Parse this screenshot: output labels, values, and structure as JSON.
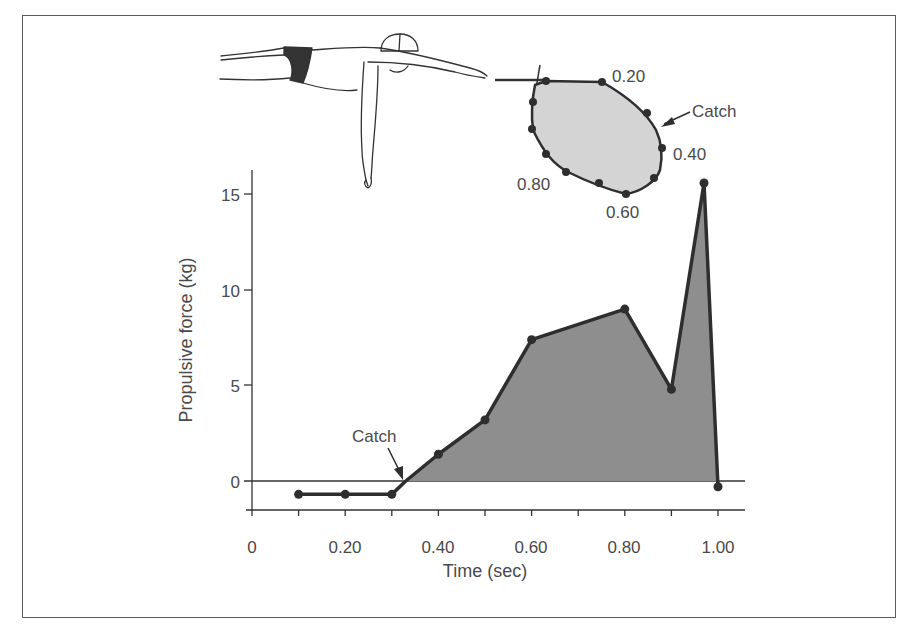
{
  "chart_data": {
    "type": "area",
    "title": "",
    "xlabel": "Time (sec)",
    "ylabel": "Propulsive force (kg)",
    "xlim": [
      0,
      1.0
    ],
    "ylim": [
      -1.5,
      16
    ],
    "grid": false,
    "legend": null,
    "x_ticks": [
      0,
      0.1,
      0.2,
      0.3,
      0.4,
      0.5,
      0.6,
      0.7,
      0.8,
      0.9,
      1.0
    ],
    "x_tick_labels": [
      "0",
      "0.20",
      "0.40",
      "0.60",
      "0.80",
      "1.00"
    ],
    "y_ticks": [
      0,
      5,
      10,
      15
    ],
    "y_tick_labels": [
      "0",
      "5",
      "10",
      "15"
    ],
    "series": [
      {
        "name": "Propulsive force",
        "x": [
          0.1,
          0.2,
          0.3,
          0.33,
          0.4,
          0.5,
          0.6,
          0.8,
          0.9,
          0.97,
          1.0
        ],
        "values": [
          -0.7,
          -0.7,
          -0.7,
          0.0,
          1.4,
          3.2,
          7.4,
          9.0,
          4.8,
          15.6,
          -0.3
        ],
        "fill_positive": true,
        "fill_color": "#8e8e8e",
        "line_color": "#2e2e2e"
      }
    ],
    "annotations": [
      {
        "text": "Catch",
        "x": 0.33,
        "y": 0,
        "type": "arrow"
      }
    ],
    "inset": {
      "description": "Hand stroke path diagram (freestyle pull pattern) with time markers",
      "labels": [
        "0.20",
        "Catch",
        "0.40",
        "0.60",
        "0.80"
      ]
    }
  },
  "labels": {
    "x_axis_title": "Time (sec)",
    "y_axis_title": "Propulsive force (kg)",
    "x_tick_0": "0",
    "x_tick_1": "0.20",
    "x_tick_2": "0.40",
    "x_tick_3": "0.60",
    "x_tick_4": "0.80",
    "x_tick_5": "1.00",
    "y_tick_0": "0",
    "y_tick_1": "5",
    "y_tick_2": "10",
    "y_tick_3": "15",
    "catch_main": "Catch",
    "inset_020": "0.20",
    "inset_catch": "Catch",
    "inset_040": "0.40",
    "inset_060": "0.60",
    "inset_080": "0.80"
  },
  "colors": {
    "fill": "#8e8e8e",
    "inset_fill": "#d4d4d4",
    "line": "#2e2e2e",
    "text": "#4a4a4a",
    "frame": "#5a5a5a"
  }
}
